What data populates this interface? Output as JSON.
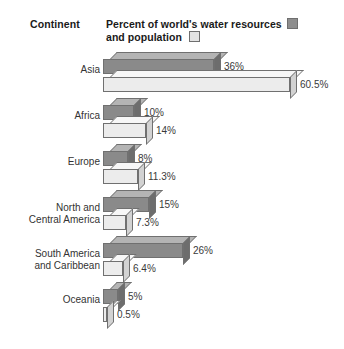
{
  "header": {
    "continent_label": "Continent",
    "legend_line1": "Percent of world's water resources",
    "legend_line2": "and population",
    "series1_name": "Percent of world's water resources",
    "series2_name": "and population"
  },
  "colors": {
    "series1_fill": "#8a8a8a",
    "series2_fill": "#ececec",
    "outline": "#707070",
    "background": "#ffffff",
    "text": "#1a1a1a"
  },
  "rows": [
    {
      "category": "Asia",
      "water_label": "36%",
      "population_label": "60.5%"
    },
    {
      "category": "Africa",
      "water_label": "10%",
      "population_label": "14%"
    },
    {
      "category": "Europe",
      "water_label": "8%",
      "population_label": "11.3%"
    },
    {
      "category": "North and\nCentral America",
      "water_label": "15%",
      "population_label": "7.3%"
    },
    {
      "category": "South America\nand Caribbean",
      "water_label": "26%",
      "population_label": "6.4%"
    },
    {
      "category": "Oceania",
      "water_label": "5%",
      "population_label": "0.5%"
    }
  ],
  "chart_data": {
    "type": "bar",
    "orientation": "horizontal",
    "title": "Percent of world's water resources and population",
    "xlabel": "",
    "ylabel": "Continent",
    "categories": [
      "Asia",
      "Africa",
      "Europe",
      "North and Central America",
      "South America and Caribbean",
      "Oceania"
    ],
    "series": [
      {
        "name": "Percent of world's water resources",
        "values": [
          36,
          10,
          8,
          15,
          26,
          5
        ],
        "labels": [
          "36%",
          "10%",
          "8%",
          "15%",
          "26%",
          "5%"
        ],
        "color": "#8a8a8a"
      },
      {
        "name": "Population",
        "values": [
          60.5,
          14,
          11.3,
          7.3,
          6.4,
          0.5
        ],
        "labels": [
          "60.5%",
          "14%",
          "11.3%",
          "7.3%",
          "6.4%",
          "0.5%"
        ],
        "color": "#ececec"
      }
    ],
    "xlim": [
      0,
      60.5
    ],
    "units": "percent",
    "grid": false,
    "legend_position": "top"
  }
}
